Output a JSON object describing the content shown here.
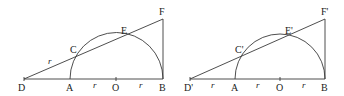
{
  "figures": [
    {
      "id": "left",
      "labels": {
        "D": "D",
        "A": "A",
        "O": "O",
        "B": "B",
        "C": "C",
        "E": "E",
        "F": "F"
      },
      "radius_label": "r"
    },
    {
      "id": "right",
      "labels": {
        "D": "D'",
        "A": "A",
        "O": "O",
        "B": "B",
        "C": "C'",
        "E": "E'",
        "F": "F'"
      },
      "radius_label": "r"
    }
  ]
}
